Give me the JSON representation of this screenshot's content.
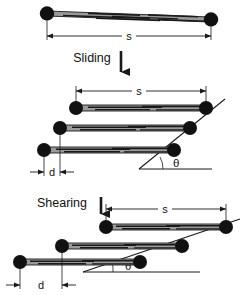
{
  "figure": {
    "title_visible": false,
    "background_color": "#ffffff",
    "stroke_color": "#1a1a1a",
    "node_fill_color": "#111111",
    "fiber_fill_color": "#8a8a8a",
    "panels": [
      {
        "id": "panel-top",
        "name": "single-fiber-bundle",
        "description_visible": false,
        "dimension_labels": [
          {
            "name": "length-s",
            "text": "s"
          }
        ]
      },
      {
        "id": "panel-middle",
        "name": "sliding-stack",
        "process_label": {
          "name": "sliding",
          "text": "Sliding"
        },
        "dimension_labels": [
          {
            "name": "length-s",
            "text": "s"
          },
          {
            "name": "offset-d",
            "text": "d"
          }
        ],
        "angle_label": {
          "name": "theta",
          "text": "θ"
        }
      },
      {
        "id": "panel-bottom",
        "name": "shearing-stack",
        "process_label": {
          "name": "shearing",
          "text": "Shearing"
        },
        "dimension_labels": [
          {
            "name": "length-s",
            "text": "s"
          },
          {
            "name": "offset-d",
            "text": "d"
          }
        ],
        "angle_label": {
          "name": "theta",
          "text": "θ"
        }
      }
    ]
  },
  "labels": {
    "s_top": "s",
    "sliding": "Sliding",
    "s_middle": "s",
    "d_middle": "d",
    "theta_middle": "θ",
    "shearing": "Shearing",
    "s_bottom": "s",
    "d_bottom": "d",
    "theta_bottom": "θ"
  },
  "colors": {
    "ink": "#1a1a1a",
    "node": "#111111",
    "fiber": "#8a8a8a",
    "background": "#ffffff"
  }
}
